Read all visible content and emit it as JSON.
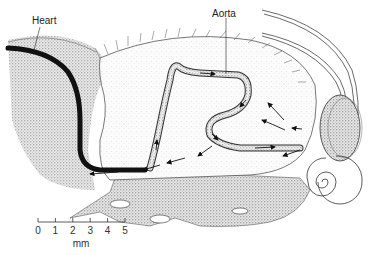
{
  "labels": {
    "heart": "Heart",
    "aorta": "Aorta"
  },
  "scale_bar": {
    "ticks": [
      "0",
      "1",
      "2",
      "3",
      "4",
      "5"
    ],
    "unit": "mm"
  },
  "colors": {
    "ink": "#1a1a1a",
    "stipple": "#9a9a9a",
    "background": "#ffffff"
  }
}
